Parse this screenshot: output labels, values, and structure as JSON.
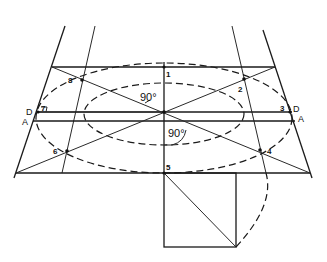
{
  "diagram": {
    "colors": {
      "ink": "#1a1a1a",
      "background": "#ffffff"
    },
    "points": [
      {
        "id": "1",
        "label": "1"
      },
      {
        "id": "2",
        "label": "2"
      },
      {
        "id": "3",
        "label": "3"
      },
      {
        "id": "4",
        "label": "4"
      },
      {
        "id": "5",
        "label": "5"
      },
      {
        "id": "6",
        "label": "6"
      },
      {
        "id": "7",
        "label": "7"
      },
      {
        "id": "8",
        "label": "8"
      }
    ],
    "side_labels": {
      "left_d": "D",
      "left_a": "A",
      "right_d": "D",
      "right_a": "A"
    },
    "angles": {
      "upper": "90°",
      "lower": "90°"
    }
  }
}
